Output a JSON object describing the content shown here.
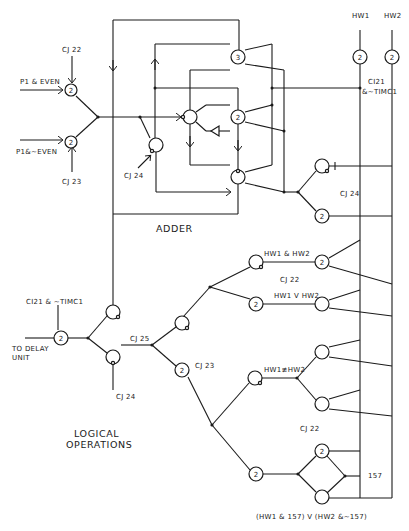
{
  "diagram": {
    "sections": {
      "adder": "ADDER",
      "logical_operations_line1": "LOGICAL",
      "logical_operations_line2": "OPERATIONS"
    },
    "inputs": {
      "p1_even": "P1 & EVEN",
      "p1_not_even": "P1&~EVEN",
      "hw1": "HW1",
      "hw2": "HW2",
      "i157": "157"
    },
    "controls": {
      "cj22_top": "CJ 22",
      "cj23_left": "CJ 23",
      "cj24_adder": "CJ 24",
      "ci21_top_line1": "CI21",
      "ci21_top_line2": "&~TIMC1",
      "cj24_right": "CJ 24",
      "cj22_logic": "CJ 22",
      "cj23_logic": "CJ 23",
      "cj25": "CJ 25",
      "cj24_bottom": "CJ 24",
      "ci21_out": "CI21 & ~TIMC1",
      "cj22_lower": "CJ 22"
    },
    "signals": {
      "hw1_and_hw2": "HW1 & HW2",
      "hw1_or_hw2": "HW1 V HW2",
      "hw1_xor_hw2": "HW1≢HW2",
      "mux_expr": "(HW1 & 157) V (HW2 &~157)"
    },
    "outputs": {
      "to_delay_line1": "TO DELAY",
      "to_delay_line2": "UNIT"
    },
    "node_thresholds": [
      "2",
      "2",
      "3",
      "2",
      "2",
      "2",
      "2",
      "2",
      "2",
      "2",
      "2",
      "2",
      "2"
    ]
  }
}
